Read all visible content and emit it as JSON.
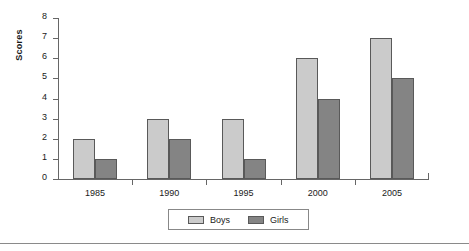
{
  "chart_data": {
    "type": "bar",
    "title": "",
    "xlabel": "",
    "ylabel": "Scores",
    "categories": [
      "1985",
      "1990",
      "1995",
      "2000",
      "2005"
    ],
    "series": [
      {
        "name": "Boys",
        "color": "#cbcbcb",
        "values": [
          2,
          3,
          3,
          6,
          7
        ]
      },
      {
        "name": "Girls",
        "color": "#848484",
        "values": [
          1,
          2,
          1,
          4,
          5
        ]
      }
    ],
    "ylim": [
      0,
      8
    ],
    "ytick_labels": [
      "0",
      "1",
      "2",
      "3",
      "4",
      "5",
      "6",
      "7",
      "8"
    ],
    "ytick_values": [
      0,
      1,
      2,
      3,
      4,
      5,
      6,
      7,
      8
    ],
    "grid": false,
    "legend_position": "bottom-center",
    "legend_entries": [
      "Boys",
      "Girls"
    ]
  },
  "axes": {
    "y_title": "Scores"
  },
  "legend": {
    "items": [
      {
        "label": "Boys"
      },
      {
        "label": "Girls"
      }
    ]
  }
}
